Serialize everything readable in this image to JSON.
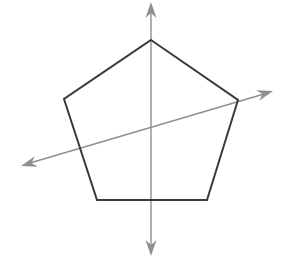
{
  "figure": {
    "title": "Regular pentagon with two lines of symmetry drawn as double-headed arrows",
    "width": 285,
    "height": 266,
    "background_color": "#ffffff"
  },
  "chart_data": {
    "type": "diagram",
    "xlabel": "",
    "ylabel": "",
    "xlim": [
      0,
      285
    ],
    "ylim": [
      0,
      266
    ],
    "grid": false,
    "legend": "none",
    "shapes": [
      {
        "name": "pentagon",
        "kind": "polygon",
        "sides": 5,
        "closed": true,
        "stroke": "#3a3a3a",
        "stroke_width": 2,
        "fill": "none",
        "points": [
          [
            151,
            40
          ],
          [
            238,
            100
          ],
          [
            207,
            200
          ],
          [
            97,
            200
          ],
          [
            64,
            99
          ]
        ],
        "vertex_labels": [
          "top-apex",
          "right",
          "bottom-right",
          "bottom-left",
          "left"
        ]
      }
    ],
    "axes_lines": [
      {
        "name": "vertical-symmetry-axis",
        "kind": "double-headed-arrow",
        "stroke": "#8f8f8f",
        "stroke_width": 1.4,
        "start": [
          151,
          10
        ],
        "end": [
          151,
          250
        ],
        "arrow_start": [
          151,
          2
        ],
        "arrow_end": [
          151,
          256
        ],
        "angle_deg": 90
      },
      {
        "name": "diagonal-symmetry-axis",
        "kind": "double-headed-arrow",
        "stroke": "#8f8f8f",
        "stroke_width": 1.4,
        "start": [
          30,
          163
        ],
        "end": [
          264,
          94
        ],
        "arrow_start": [
          21,
          166
        ],
        "arrow_end": [
          273,
          91
        ],
        "angle_deg": 16.4
      }
    ],
    "arrowheads": {
      "fill": "#8f8f8f",
      "length": 16,
      "width": 11,
      "count": 4
    },
    "annotations": [],
    "tick_labels": [],
    "data_labels": []
  }
}
